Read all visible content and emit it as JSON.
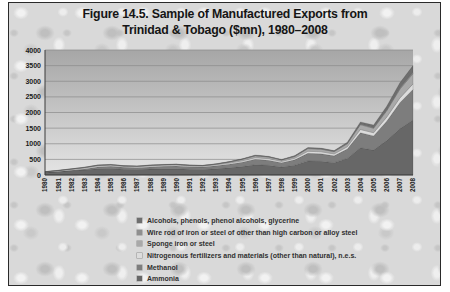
{
  "figure": {
    "title_line1": "Figure 14.5. Sample of Manufactured Exports from",
    "title_line2": "Trinidad & Tobago ($mn), 1980–2008"
  },
  "chart_data": {
    "type": "area",
    "stacked": true,
    "title": "Figure 14.5. Sample of Manufactured Exports from Trinidad & Tobago ($mn), 1980–2008",
    "xlabel": "",
    "ylabel": "",
    "ylim": [
      0,
      4000
    ],
    "yticks": [
      0,
      500,
      1000,
      1500,
      2000,
      2500,
      3000,
      3500,
      4000
    ],
    "grid": true,
    "legend_position": "bottom",
    "x": [
      1980,
      1981,
      1982,
      1983,
      1984,
      1985,
      1986,
      1987,
      1988,
      1989,
      1990,
      1991,
      1992,
      1993,
      1994,
      1995,
      1996,
      1997,
      1998,
      1999,
      2000,
      2001,
      2002,
      2003,
      2004,
      2005,
      2006,
      2007,
      2008
    ],
    "series": [
      {
        "name": "Ammonia",
        "color": "#676767",
        "values": [
          85,
          110,
          140,
          165,
          200,
          210,
          185,
          175,
          190,
          200,
          200,
          185,
          175,
          200,
          230,
          270,
          330,
          310,
          255,
          315,
          450,
          440,
          395,
          530,
          870,
          800,
          1100,
          1480,
          1760
        ]
      },
      {
        "name": "Methanol",
        "color": "#7d7d7d",
        "values": [
          0,
          5,
          15,
          30,
          60,
          70,
          60,
          60,
          70,
          80,
          90,
          80,
          80,
          95,
          115,
          140,
          175,
          165,
          140,
          170,
          245,
          240,
          220,
          300,
          480,
          450,
          620,
          830,
          980
        ]
      },
      {
        "name": "Nitrogenous fertilizers and materials (other than natural), n.e.s.",
        "color": "#dcdcdc",
        "values": [
          18,
          22,
          25,
          28,
          30,
          30,
          28,
          27,
          30,
          30,
          30,
          27,
          27,
          30,
          35,
          40,
          50,
          47,
          40,
          48,
          65,
          63,
          58,
          72,
          105,
          100,
          130,
          155,
          175
        ]
      },
      {
        "name": "Sponge iron or steel",
        "color": "#a9a9a9",
        "values": [
          0,
          5,
          12,
          18,
          20,
          20,
          18,
          18,
          20,
          20,
          20,
          18,
          18,
          22,
          32,
          48,
          58,
          55,
          46,
          58,
          85,
          83,
          75,
          95,
          155,
          145,
          205,
          280,
          330
        ]
      },
      {
        "name": "Wire rod of iron or steel of other than high carbon or alloy steel",
        "color": "#8f8f8f",
        "values": [
          4,
          4,
          4,
          4,
          4,
          4,
          4,
          4,
          4,
          4,
          4,
          4,
          4,
          4,
          6,
          7,
          9,
          8,
          7,
          9,
          13,
          13,
          12,
          16,
          25,
          24,
          33,
          45,
          50
        ]
      },
      {
        "name": "Alcohols, phenols, phenol alcohols, glycerine",
        "color": "#6e6e6e",
        "values": [
          3,
          4,
          4,
          5,
          6,
          6,
          5,
          6,
          6,
          6,
          6,
          6,
          6,
          9,
          12,
          15,
          18,
          15,
          12,
          20,
          22,
          21,
          20,
          37,
          65,
          81,
          112,
          160,
          205
        ]
      }
    ],
    "legend_items": [
      {
        "label": "Alcohols, phenols, phenol alcohols, glycerine",
        "color": "#6e6e6e"
      },
      {
        "label": "Wire rod of iron or steel of other than high carbon or alloy steel",
        "color": "#8f8f8f"
      },
      {
        "label": "Sponge iron or steel",
        "color": "#a9a9a9"
      },
      {
        "label": "Nitrogenous fertilizers and materials (other than natural), n.e.s.",
        "color": "#dcdcdc"
      },
      {
        "label": "Methanol",
        "color": "#7d7d7d"
      },
      {
        "label": "Ammonia",
        "color": "#676767"
      }
    ],
    "colors": {
      "plot_bg_top": "#a6a6a6",
      "plot_bg_bottom": "#e5e5e5",
      "gridline": "#8a8a8a",
      "axis": "#3a3a3a",
      "tick_text": "#1a1a1a"
    }
  }
}
